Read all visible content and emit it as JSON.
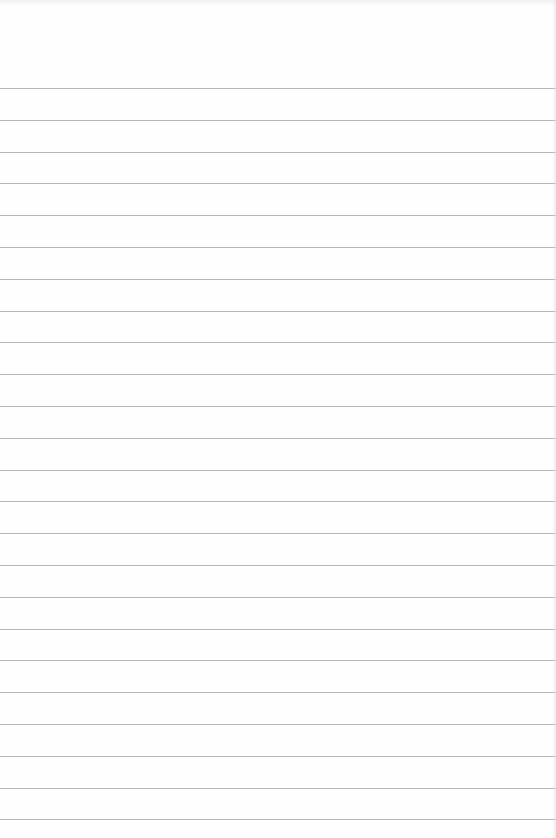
{
  "document": {
    "type": "ruled-notebook-page",
    "background_color": "#fefefe",
    "rule_color": "#a9a9a9",
    "header_text": "",
    "rules": {
      "count": 24,
      "first_y": 88,
      "spacing": 31.8
    }
  }
}
